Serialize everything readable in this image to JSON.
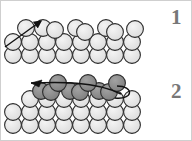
{
  "figure": {
    "background_color": "#ffffff",
    "border_color": "#cfcfcf",
    "width": 192,
    "height": 141
  },
  "panels": [
    {
      "id": "panel-1",
      "label": "1",
      "label_color": "#777777",
      "description": "Flat close-packed substrate of light spheres with a straight arrow crossing the top-left, pointing up-right",
      "sphere_fill_light": "#e6e6e6",
      "sphere_stroke": "#2b2b2b",
      "arrow": {
        "name": "straight-arrow",
        "direction": "up-right",
        "color": "#111111",
        "x1": 4,
        "y1": 46,
        "x2": 42,
        "y2": 19
      },
      "rows": [
        {
          "name": "top-row",
          "fill": "#e6e6e6",
          "cy": 27,
          "r": 8.4,
          "cx": [
            25,
            42,
            54,
            75,
            84,
            105,
            113,
            134
          ]
        },
        {
          "name": "middle-row",
          "fill": "#e6e6e6",
          "cy": 41,
          "r": 8.4,
          "cx": [
            12,
            29,
            46,
            63,
            80,
            97,
            114,
            131
          ]
        },
        {
          "name": "bottom-row",
          "fill": "#e6e6e6",
          "cy": 54,
          "r": 8.4,
          "cx": [
            12,
            29,
            46,
            63,
            80,
            97,
            114,
            131
          ]
        }
      ]
    },
    {
      "id": "panel-2",
      "label": "2",
      "label_color": "#777777",
      "description": "Same substrate with an added dark adsorbed top layer of spheres, a bent arrow pointing up-left, and a curved hook line at the right end",
      "sphere_fill_light": "#e6e6e6",
      "sphere_fill_dark": "#8c8c8c",
      "sphere_stroke": "#2b2b2b",
      "arrow": {
        "name": "curved-arrow",
        "direction": "up-left",
        "color": "#111111",
        "path": "M118,96 C96,80 60,80 26,80"
      },
      "hook": {
        "name": "hook-curve",
        "color": "#111111",
        "path": "M118,84 C134,84 134,98 118,98"
      },
      "rows": [
        {
          "name": "adlayer-top-row",
          "fill": "#8c8c8c",
          "cy": 82,
          "r": 8.4,
          "cx": [
            57,
            87,
            116
          ]
        },
        {
          "name": "adlayer-row",
          "fill": "#8c8c8c",
          "cy": 90,
          "r": 8.4,
          "cx": [
            40,
            50,
            69,
            79,
            98,
            108
          ]
        },
        {
          "name": "substrate-top-row",
          "fill": "#e6e6e6",
          "cy": 98,
          "r": 8.4,
          "cx": [
            29,
            46,
            63,
            80,
            97,
            114,
            131
          ]
        },
        {
          "name": "substrate-middle-row",
          "fill": "#e6e6e6",
          "cy": 111,
          "r": 8.4,
          "cx": [
            12,
            29,
            46,
            63,
            80,
            97,
            114,
            131
          ]
        },
        {
          "name": "substrate-bottom-row",
          "fill": "#e6e6e6",
          "cy": 124,
          "r": 8.4,
          "cx": [
            12,
            29,
            46,
            63,
            80,
            97,
            114,
            131
          ]
        }
      ]
    }
  ]
}
